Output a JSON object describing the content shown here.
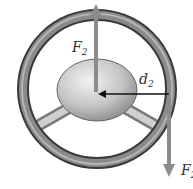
{
  "diagram": {
    "labels": {
      "force_up": "F",
      "force_up_sub": "2",
      "distance": "d",
      "distance_sub": "2",
      "force_down": "F",
      "force_down_sub": "2"
    },
    "colors": {
      "force_arrow": "#8c8c8c",
      "distance_arrow": "#111111",
      "rim": "#6a6a6a",
      "hub": "#c8c8c8"
    }
  }
}
